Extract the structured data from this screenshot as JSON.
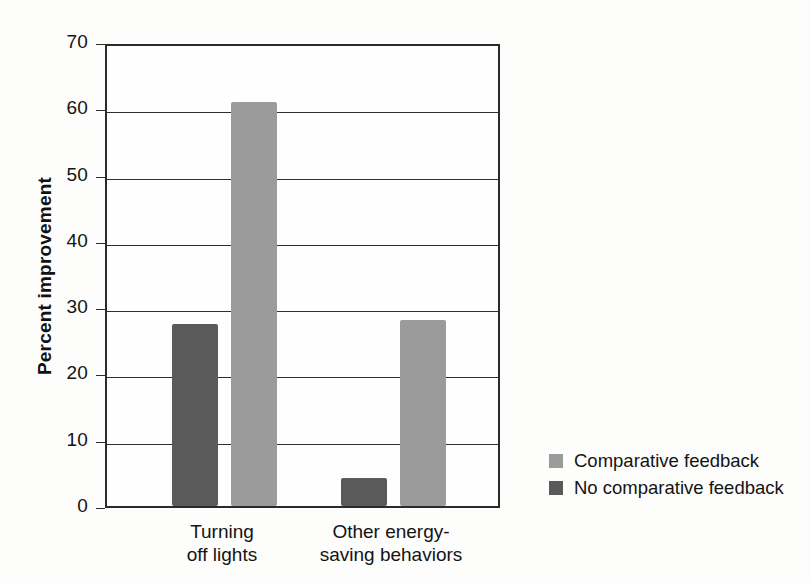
{
  "chart_data": {
    "type": "bar",
    "title": "",
    "xlabel": "",
    "ylabel": "Percent improvement",
    "ylim": [
      0,
      70
    ],
    "ytick_labels": [
      "70",
      "60",
      "50",
      "40",
      "30",
      "20",
      "10",
      "0"
    ],
    "yticks": [
      70,
      60,
      50,
      40,
      30,
      20,
      10,
      0
    ],
    "grid": true,
    "legend_position": "right",
    "categories": [
      "Turning off lights",
      "Other energy-saving behaviors"
    ],
    "category_label_lines": [
      [
        "Turning",
        "off lights"
      ],
      [
        "Other energy-",
        "saving behaviors"
      ]
    ],
    "series": [
      {
        "name": "No comparative feedback",
        "color": "#5a5a5a",
        "values": [
          27.5,
          4.2
        ]
      },
      {
        "name": "Comparative feedback",
        "color": "#9b9b9b",
        "values": [
          61.0,
          28.0
        ]
      }
    ],
    "legend_entries": [
      {
        "label": "Comparative feedback",
        "color": "#9b9b9b"
      },
      {
        "label": "No comparative feedback",
        "color": "#5a5a5a"
      }
    ]
  }
}
